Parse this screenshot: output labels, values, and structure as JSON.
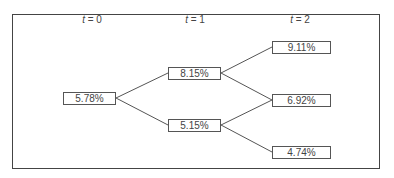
{
  "diagram": {
    "type": "binomial-interest-rate-tree",
    "time_labels": [
      {
        "var": "t",
        "eq": " = 0",
        "x": 92
      },
      {
        "var": "t",
        "eq": " = 1",
        "x": 195
      },
      {
        "var": "t",
        "eq": " = 2",
        "x": 300
      }
    ],
    "nodes": {
      "n0": {
        "label": "5.78%",
        "period": 0
      },
      "n1u": {
        "label": "8.15%",
        "period": 1
      },
      "n1d": {
        "label": "5.15%",
        "period": 1
      },
      "n2uu": {
        "label": "9.11%",
        "period": 2
      },
      "n2ud": {
        "label": "6.92%",
        "period": 2
      },
      "n2dd": {
        "label": "4.74%",
        "period": 2
      }
    },
    "edges": [
      [
        "5.78%",
        "8.15%"
      ],
      [
        "5.78%",
        "5.15%"
      ],
      [
        "8.15%",
        "9.11%"
      ],
      [
        "8.15%",
        "6.92%"
      ],
      [
        "5.15%",
        "6.92%"
      ],
      [
        "5.15%",
        "4.74%"
      ]
    ]
  }
}
